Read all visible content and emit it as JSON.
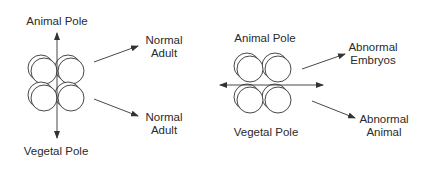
{
  "left_embryo": {
    "top_label": "Animal Pole",
    "bottom_label": "Vegetal Pole",
    "outcome_top": {
      "line1": "Normal",
      "line2": "Adult"
    },
    "outcome_bottom": {
      "line1": "Normal",
      "line2": "Adult"
    }
  },
  "right_embryo": {
    "top_label": "Animal Pole",
    "bottom_label": "Vegetal Pole",
    "outcome_top": {
      "line1": "Abnormal",
      "line2": "Embryos"
    },
    "outcome_bottom": {
      "line1": "Abnormal",
      "line2": "Animal"
    }
  },
  "colors": {
    "stroke": "#333333",
    "background": "#ffffff"
  }
}
